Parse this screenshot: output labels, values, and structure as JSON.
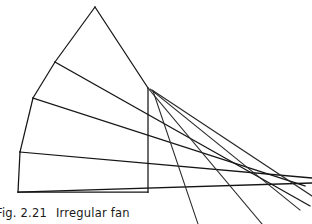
{
  "figure": {
    "caption_label": "Fig. 2.21",
    "caption_title": "Irregular fan",
    "caption_full": "Fig. 2.21   Irregular fan",
    "ink_color": "#151515",
    "background_color": "#ffffff",
    "canvas": {
      "width": 312,
      "height": 224
    }
  },
  "drawing": {
    "type": "line-drawing",
    "description": "Irregular fan: fan-shaped polygon outline with internal rib lines radiating toward the right where extended rays cross",
    "outline": {
      "name": "fan-body-outline",
      "points": "95,7 148,88 148,192 18,192 20,152 33,98 55,62 95,7"
    },
    "segments": [
      {
        "name": "apex-left-edge",
        "from": [
          95,
          7
        ],
        "to": [
          55,
          62
        ]
      },
      {
        "name": "upper-left-edge",
        "from": [
          55,
          62
        ],
        "to": [
          33,
          98
        ]
      },
      {
        "name": "mid-left-edge",
        "from": [
          33,
          98
        ],
        "to": [
          20,
          152
        ]
      },
      {
        "name": "lower-left-edge",
        "from": [
          20,
          152
        ],
        "to": [
          18,
          192
        ]
      },
      {
        "name": "bottom-edge",
        "from": [
          18,
          192
        ],
        "to": [
          148,
          192
        ]
      },
      {
        "name": "right-vertical-edge",
        "from": [
          148,
          88
        ],
        "to": [
          148,
          192
        ]
      },
      {
        "name": "apex-right-edge",
        "from": [
          95,
          7
        ],
        "to": [
          148,
          88
        ]
      }
    ],
    "ribs": [
      {
        "name": "rib-1-from-upper-left",
        "from": [
          55,
          62
        ],
        "to": [
          310,
          206
        ]
      },
      {
        "name": "rib-2-from-mid-left",
        "from": [
          33,
          98
        ],
        "to": [
          305,
          186
        ]
      },
      {
        "name": "rib-3-from-lower-left",
        "from": [
          20,
          152
        ],
        "to": [
          312,
          178
        ]
      },
      {
        "name": "rib-4-bottom-extension",
        "from": [
          18,
          192
        ],
        "to": [
          312,
          183
        ]
      }
    ],
    "rays": [
      {
        "name": "ray-1-from-right-top",
        "from": [
          148,
          88
        ],
        "to": [
          262,
          224
        ]
      },
      {
        "name": "ray-2-from-right-top",
        "from": [
          150,
          89
        ],
        "to": [
          300,
          210
        ]
      },
      {
        "name": "ray-3-from-right-top",
        "from": [
          152,
          90
        ],
        "to": [
          312,
          196
        ]
      },
      {
        "name": "ray-4-from-right-top",
        "from": [
          153,
          91
        ],
        "to": [
          198,
          224
        ]
      }
    ],
    "crossing_region": {
      "name": "ray-convergence",
      "x": 183,
      "y": 157
    }
  }
}
